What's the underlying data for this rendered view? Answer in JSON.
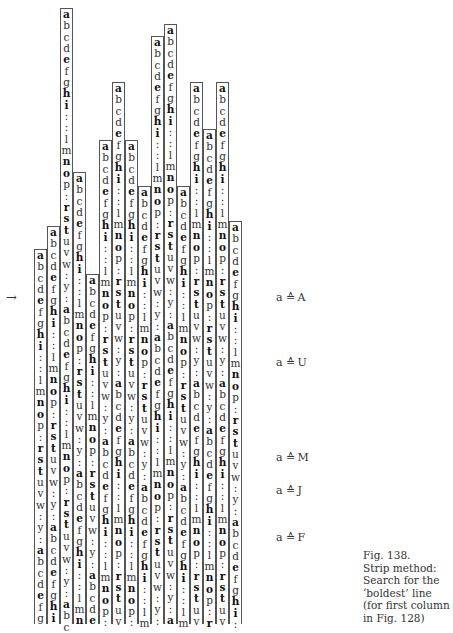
{
  "figure": {
    "cycle": [
      "a",
      "b",
      "c",
      "d",
      "e",
      "f",
      "g",
      "h",
      "i",
      ":",
      ":",
      "l",
      "m",
      "n",
      "o",
      "p",
      ":",
      "r",
      "s",
      "t",
      "u",
      "v",
      "w",
      ":",
      "y",
      ":"
    ],
    "bold_letters": [
      "a",
      "e",
      "h",
      "i",
      "n",
      "o",
      "r",
      "s",
      "t"
    ],
    "row_height": 11.35,
    "bottom_y": 624,
    "columns": [
      {
        "x": 34,
        "top": 249
      },
      {
        "x": 47,
        "top": 226
      },
      {
        "x": 60,
        "top": 8
      },
      {
        "x": 73,
        "top": 172
      },
      {
        "x": 86,
        "top": 274
      },
      {
        "x": 99,
        "top": 140
      },
      {
        "x": 112,
        "top": 82
      },
      {
        "x": 125,
        "top": 140
      },
      {
        "x": 138,
        "top": 186
      },
      {
        "x": 151,
        "top": 36
      },
      {
        "x": 164,
        "top": 24
      },
      {
        "x": 177,
        "top": 186
      },
      {
        "x": 190,
        "top": 82
      },
      {
        "x": 203,
        "top": 129
      },
      {
        "x": 216,
        "top": 82
      },
      {
        "x": 229,
        "top": 221
      }
    ],
    "arrow": "→",
    "labels": [
      {
        "left": "a",
        "eq": "≙",
        "right": "A",
        "top": 291
      },
      {
        "left": "a",
        "eq": "≙",
        "right": "U",
        "top": 356
      },
      {
        "left": "a",
        "eq": "≙",
        "right": "M",
        "top": 451
      },
      {
        "left": "a",
        "eq": "≙",
        "right": "J",
        "top": 484
      },
      {
        "left": "a",
        "eq": "≙",
        "right": "F",
        "top": 531
      }
    ],
    "caption": [
      "Fig. 138.",
      "Strip method:",
      "Search for the",
      "‘boldest’ line",
      "(for first column",
      "in Fig. 128)"
    ]
  }
}
